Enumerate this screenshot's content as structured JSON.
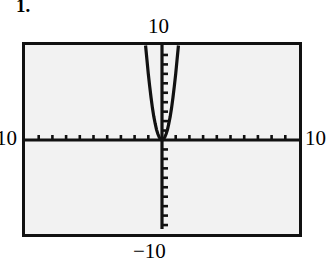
{
  "problem": {
    "number_label": "1."
  },
  "graph": {
    "window_labels": {
      "ymax": "10",
      "ymin": "−10",
      "xmin": "10",
      "xmax": "10"
    },
    "colors": {
      "frame": "#111111",
      "screen_background": "#f2f2f2",
      "axis": "#111111",
      "curve": "#111111"
    }
  },
  "chart_data": {
    "type": "line",
    "title": "",
    "subtitle": "",
    "xlabel": "",
    "ylabel": "",
    "xlim": [
      -10,
      10
    ],
    "ylim": [
      -10,
      10
    ],
    "grid": false,
    "legend": null,
    "tick_interval_x": 1,
    "tick_interval_y": 1,
    "axis_tick_labels_x": [
      "10",
      "10"
    ],
    "axis_tick_labels_y": [
      "10",
      "−10"
    ],
    "annotations": [
      "1."
    ],
    "series": [
      {
        "name": "y = 7x^2",
        "equation": "y = 7x^2",
        "vertex": [
          0,
          0
        ],
        "x": [
          -1.2,
          -1.1,
          -1.0,
          -0.9,
          -0.8,
          -0.7,
          -0.6,
          -0.5,
          -0.4,
          -0.3,
          -0.2,
          -0.1,
          0.0,
          0.1,
          0.2,
          0.3,
          0.4,
          0.5,
          0.6,
          0.7,
          0.8,
          0.9,
          1.0,
          1.1,
          1.2
        ],
        "values": [
          10.0,
          8.5,
          7.0,
          5.7,
          4.5,
          3.4,
          2.5,
          1.75,
          1.1,
          0.63,
          0.28,
          0.07,
          0.0,
          0.07,
          0.28,
          0.63,
          1.1,
          1.75,
          2.5,
          3.4,
          4.5,
          5.7,
          7.0,
          8.5,
          10.0
        ]
      }
    ]
  }
}
